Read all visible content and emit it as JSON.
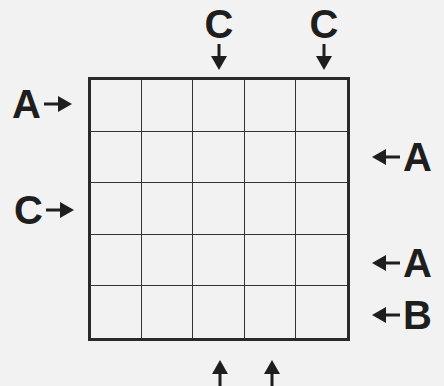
{
  "puzzle": {
    "type": "letter-placement-grid",
    "rows": 5,
    "cols": 5,
    "cells": [
      [
        "",
        "",
        "",
        "",
        ""
      ],
      [
        "",
        "",
        "",
        "",
        ""
      ],
      [
        "",
        "",
        "",
        "",
        ""
      ],
      [
        "",
        "",
        "",
        "",
        ""
      ],
      [
        "",
        "",
        "",
        "",
        ""
      ]
    ],
    "clues": {
      "top": [
        {
          "col": 3,
          "letter": "C"
        },
        {
          "col": 5,
          "letter": "C"
        }
      ],
      "left": [
        {
          "row": 1,
          "letter": "A"
        },
        {
          "row": 3,
          "letter": "C"
        }
      ],
      "right": [
        {
          "row": 2,
          "letter": "A"
        },
        {
          "row": 4,
          "letter": "A"
        },
        {
          "row": 5,
          "letter": "B"
        }
      ],
      "bottom": [
        {
          "col": 3,
          "letter": ""
        },
        {
          "col": 4,
          "letter": ""
        }
      ]
    },
    "colors": {
      "ink": "#1e1e1e",
      "background": "#f2f2f2"
    }
  }
}
